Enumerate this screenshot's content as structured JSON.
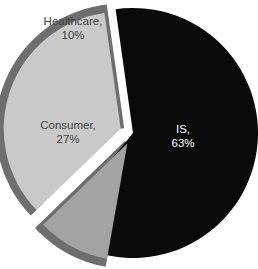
{
  "chart_data": {
    "type": "pie",
    "title": "",
    "subtitle": "",
    "xlabel": "",
    "ylabel": "",
    "legend": "none",
    "grid": false,
    "style": "3d-exploded-pie",
    "background": "#ffffff",
    "total": 100,
    "units": "%",
    "categories": [
      "IS",
      "Consumer",
      "Healthcare"
    ],
    "values": [
      63,
      27,
      10
    ],
    "labels": [
      "IS,\n63%",
      "Consumer,\n27%",
      "Healthcare,\n10%"
    ],
    "slices": [
      {
        "name": "IS",
        "value": 63,
        "value_text": "63%",
        "label_line1": "IS,",
        "label_line2": "63%",
        "fill": "#0a0a0a",
        "edge": "#000000",
        "text_color": "#ffffff",
        "text_tone": "light",
        "exploded": false,
        "explode_offset": 0,
        "start_angle": 356,
        "end_angle": 583,
        "label_x": 183,
        "label_y": 130
      },
      {
        "name": "Consumer",
        "value": 27,
        "value_text": "27%",
        "label_line1": "Consumer,",
        "label_line2": "27%",
        "fill": "#c9c9c9",
        "edge": "#6e6e6e",
        "text_color": "#3f3f3f",
        "text_tone": "dark",
        "exploded": true,
        "explode_offset": 13,
        "start_angle": 230,
        "end_angle": 356,
        "label_x": 68,
        "label_y": 126
      },
      {
        "name": "Healthcare",
        "value": 10,
        "value_text": "10%",
        "label_line1": "Healthcare,",
        "label_line2": "10%",
        "fill": "#a3a3a3",
        "edge": "#6e6e6e",
        "text_color": "#3f3f3f",
        "text_tone": "dark",
        "exploded": true,
        "explode_offset": 12,
        "start_angle": 194,
        "end_angle": 230,
        "label_x": 73,
        "label_y": 22
      }
    ],
    "geometry": {
      "center_x": 133,
      "center_y": 133,
      "radius": 125,
      "start_offset_deg": -4
    }
  }
}
